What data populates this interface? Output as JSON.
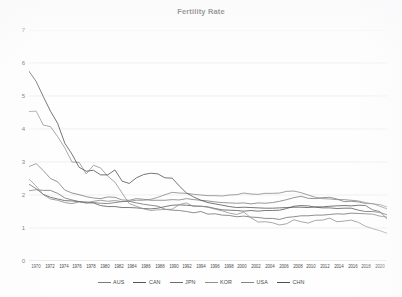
{
  "chart_data": {
    "type": "line",
    "title": "Fertility Rate",
    "xlabel": "",
    "ylabel": "",
    "ylim": [
      0,
      7
    ],
    "yticks": [
      0,
      1,
      2,
      3,
      4,
      5,
      6,
      7
    ],
    "grid": true,
    "legend_position": "bottom",
    "x": [
      1970,
      1971,
      1972,
      1973,
      1974,
      1975,
      1976,
      1977,
      1978,
      1979,
      1980,
      1981,
      1982,
      1983,
      1984,
      1985,
      1986,
      1987,
      1988,
      1989,
      1990,
      1991,
      1992,
      1993,
      1994,
      1995,
      1996,
      1997,
      1998,
      1999,
      2000,
      2001,
      2002,
      2003,
      2004,
      2005,
      2006,
      2007,
      2008,
      2009,
      2010,
      2011,
      2012,
      2013,
      2014,
      2015,
      2016,
      2017,
      2018,
      2019,
      2020
    ],
    "xtick_labels": [
      "1970",
      "1972",
      "1974",
      "1976",
      "1978",
      "1980",
      "1982",
      "1984",
      "1986",
      "1988",
      "1990",
      "1992",
      "1994",
      "1996",
      "1998",
      "2000",
      "2002",
      "2004",
      "2006",
      "2008",
      "2010",
      "2012",
      "2014",
      "2016",
      "2018",
      "2020"
    ],
    "series": [
      {
        "name": "AUS",
        "color": "#7a7a7a",
        "values": [
          2.86,
          2.95,
          2.74,
          2.5,
          2.4,
          2.15,
          2.06,
          2.01,
          1.95,
          1.91,
          1.89,
          1.94,
          1.93,
          1.85,
          1.84,
          1.89,
          1.87,
          1.84,
          1.84,
          1.84,
          1.86,
          1.85,
          1.89,
          1.86,
          1.84,
          1.82,
          1.79,
          1.77,
          1.76,
          1.75,
          1.76,
          1.73,
          1.76,
          1.75,
          1.77,
          1.81,
          1.86,
          1.92,
          1.96,
          1.9,
          1.89,
          1.92,
          1.93,
          1.88,
          1.8,
          1.81,
          1.79,
          1.74,
          1.74,
          1.66,
          1.58
        ]
      },
      {
        "name": "CAN",
        "color": "#565656",
        "values": [
          2.33,
          2.19,
          2.02,
          1.93,
          1.88,
          1.83,
          1.82,
          1.8,
          1.76,
          1.76,
          1.68,
          1.65,
          1.65,
          1.62,
          1.62,
          1.61,
          1.59,
          1.58,
          1.6,
          1.65,
          1.69,
          1.7,
          1.69,
          1.67,
          1.66,
          1.64,
          1.59,
          1.55,
          1.54,
          1.53,
          1.51,
          1.53,
          1.51,
          1.53,
          1.53,
          1.54,
          1.59,
          1.66,
          1.68,
          1.67,
          1.63,
          1.61,
          1.61,
          1.59,
          1.6,
          1.6,
          1.54,
          1.5,
          1.5,
          1.47,
          1.4
        ]
      },
      {
        "name": "JPN",
        "color": "#6e6e6e",
        "values": [
          2.13,
          2.16,
          2.14,
          2.14,
          2.05,
          1.91,
          1.85,
          1.8,
          1.79,
          1.77,
          1.75,
          1.74,
          1.77,
          1.8,
          1.81,
          1.76,
          1.72,
          1.69,
          1.66,
          1.57,
          1.54,
          1.53,
          1.5,
          1.46,
          1.5,
          1.42,
          1.43,
          1.39,
          1.38,
          1.34,
          1.36,
          1.33,
          1.32,
          1.29,
          1.29,
          1.26,
          1.32,
          1.34,
          1.37,
          1.37,
          1.39,
          1.39,
          1.41,
          1.43,
          1.42,
          1.45,
          1.44,
          1.43,
          1.42,
          1.36,
          1.33
        ]
      },
      {
        "name": "KOR",
        "color": "#909090",
        "values": [
          4.53,
          4.54,
          4.12,
          4.07,
          3.77,
          3.43,
          3.0,
          2.99,
          2.64,
          2.9,
          2.82,
          2.57,
          2.39,
          2.06,
          1.74,
          1.66,
          1.58,
          1.53,
          1.55,
          1.56,
          1.57,
          1.71,
          1.76,
          1.65,
          1.66,
          1.63,
          1.57,
          1.52,
          1.45,
          1.41,
          1.48,
          1.31,
          1.18,
          1.19,
          1.16,
          1.09,
          1.13,
          1.25,
          1.19,
          1.15,
          1.23,
          1.24,
          1.3,
          1.19,
          1.21,
          1.24,
          1.17,
          1.05,
          0.98,
          0.92,
          0.84
        ]
      },
      {
        "name": "USA",
        "color": "#858585",
        "values": [
          2.48,
          2.27,
          2.01,
          1.88,
          1.84,
          1.77,
          1.74,
          1.79,
          1.76,
          1.81,
          1.84,
          1.81,
          1.83,
          1.8,
          1.81,
          1.84,
          1.84,
          1.87,
          1.93,
          2.01,
          2.08,
          2.06,
          2.05,
          2.02,
          2.0,
          1.98,
          1.98,
          1.97,
          2.0,
          2.01,
          2.06,
          2.03,
          2.02,
          2.05,
          2.05,
          2.06,
          2.11,
          2.12,
          2.07,
          2.0,
          1.93,
          1.89,
          1.88,
          1.86,
          1.86,
          1.84,
          1.82,
          1.77,
          1.73,
          1.71,
          1.64
        ]
      },
      {
        "name": "CHN",
        "color": "#4f4f4f",
        "values": [
          5.75,
          5.44,
          4.98,
          4.54,
          4.17,
          3.57,
          3.24,
          2.84,
          2.72,
          2.75,
          2.61,
          2.61,
          2.76,
          2.42,
          2.35,
          2.52,
          2.62,
          2.66,
          2.64,
          2.52,
          2.51,
          2.27,
          2.06,
          1.94,
          1.84,
          1.77,
          1.73,
          1.69,
          1.65,
          1.62,
          1.63,
          1.62,
          1.61,
          1.6,
          1.6,
          1.61,
          1.62,
          1.63,
          1.63,
          1.62,
          1.64,
          1.64,
          1.66,
          1.67,
          1.68,
          1.67,
          1.69,
          1.68,
          1.55,
          1.5,
          1.28
        ]
      }
    ]
  },
  "legend": {
    "items": [
      {
        "label": "AUS"
      },
      {
        "label": "CAN"
      },
      {
        "label": "JPN"
      },
      {
        "label": "KOR"
      },
      {
        "label": "USA"
      },
      {
        "label": "CHN"
      }
    ]
  }
}
